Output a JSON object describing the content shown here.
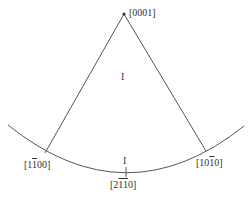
{
  "diagram": {
    "type": "stereographic-triangle",
    "apex": {
      "label_pre": "[000",
      "label_post": "1]",
      "full": "[0001]"
    },
    "left_corner": {
      "label_pre": "[1",
      "label_bar": "1",
      "label_post": "00]",
      "full": "[1-100]"
    },
    "right_corner": {
      "label_pre": "[10",
      "label_bar": "1",
      "label_post": "0]",
      "full": "[10-10]"
    },
    "bottom_mid": {
      "label_pre": "[2",
      "label_bar": "11",
      "label_post": "0]",
      "full": "[2-1-10]"
    },
    "region_label_upper": "I",
    "region_label_lower": "I",
    "colors": {
      "line": "#555555",
      "text": "#333333",
      "background": "#ffffff"
    }
  }
}
